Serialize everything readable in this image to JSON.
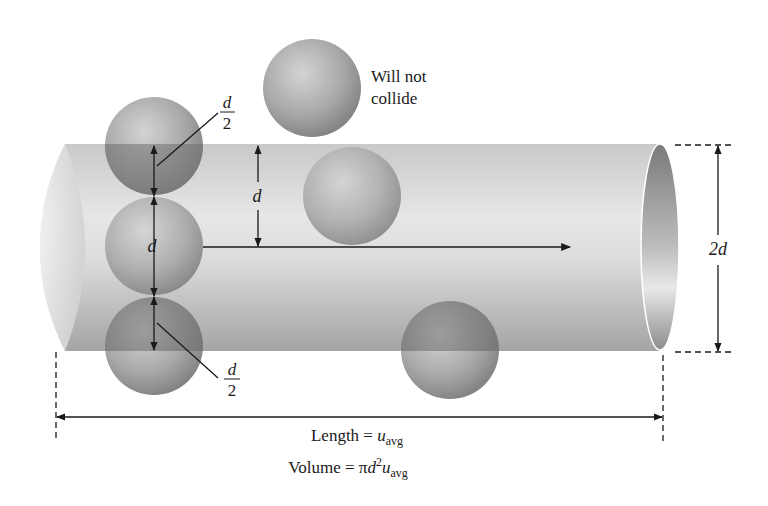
{
  "figure": {
    "colors": {
      "background": "#ffffff",
      "cylinder_light": "#eeeeee",
      "cylinder_dark": "#9a9a9a",
      "sphere_light": "#d0d0d0",
      "sphere_dark": "#7c7c7c",
      "line": "#1a1a1a"
    },
    "labels": {
      "will_not_collide_line1": "Will not",
      "will_not_collide_line2": "collide",
      "half_d_top_num": "d",
      "half_d_top_den": "2",
      "half_d_bottom_num": "d",
      "half_d_bottom_den": "2",
      "d_stack": "d",
      "d_radius": "d",
      "diameter_2d": "2d",
      "length_prefix": "Length = ",
      "length_var": "u",
      "length_sub": "avg",
      "volume_prefix": "Volume = π",
      "volume_var_d": "d",
      "volume_sup": "2",
      "volume_var_u": "u",
      "volume_sub": "avg"
    },
    "spheres": [
      {
        "id": "stack-top",
        "cx": 154,
        "cy": 146,
        "r": 49,
        "overlaps_cylinder": true
      },
      {
        "id": "stack-middle",
        "cx": 154,
        "cy": 246,
        "r": 49,
        "overlaps_cylinder": true
      },
      {
        "id": "stack-bottom",
        "cx": 154,
        "cy": 346,
        "r": 49,
        "overlaps_cylinder": true
      },
      {
        "id": "outside-will-not-collide",
        "cx": 312,
        "cy": 88,
        "r": 49,
        "overlaps_cylinder": false
      },
      {
        "id": "inside-cylinder",
        "cx": 352,
        "cy": 196,
        "r": 49,
        "overlaps_cylinder": true
      },
      {
        "id": "bottom-right",
        "cx": 450,
        "cy": 350,
        "r": 49,
        "overlaps_cylinder": true
      }
    ]
  }
}
